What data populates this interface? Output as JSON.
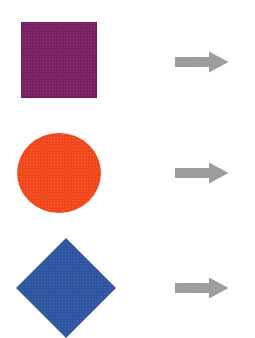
{
  "canvas": {
    "width": 255,
    "height": 338,
    "background": "#ffffff"
  },
  "shapes": [
    {
      "name": "square",
      "label": "Purple square",
      "color": "#7b1f63",
      "x": 21,
      "y": 22,
      "width": 76,
      "height": 76
    },
    {
      "name": "circle",
      "label": "Orange-red circle",
      "color": "#f0481c",
      "x": 17,
      "y": 133,
      "width": 84,
      "height": 80
    },
    {
      "name": "diamond",
      "label": "Blue diamond",
      "color": "#2f54a0",
      "x": 16,
      "y": 238,
      "width": 100,
      "height": 100
    }
  ],
  "arrows": [
    {
      "name": "arrow-row-1",
      "label": "Right arrow",
      "color": "#a3a3a3",
      "x": 175,
      "y": 51,
      "width": 54,
      "height": 22,
      "direction": "right"
    },
    {
      "name": "arrow-row-2",
      "label": "Right arrow",
      "color": "#a3a3a3",
      "x": 175,
      "y": 162,
      "width": 54,
      "height": 22,
      "direction": "right"
    },
    {
      "name": "arrow-row-3",
      "label": "Right arrow",
      "color": "#a3a3a3",
      "x": 175,
      "y": 277,
      "width": 54,
      "height": 22,
      "direction": "right"
    }
  ]
}
